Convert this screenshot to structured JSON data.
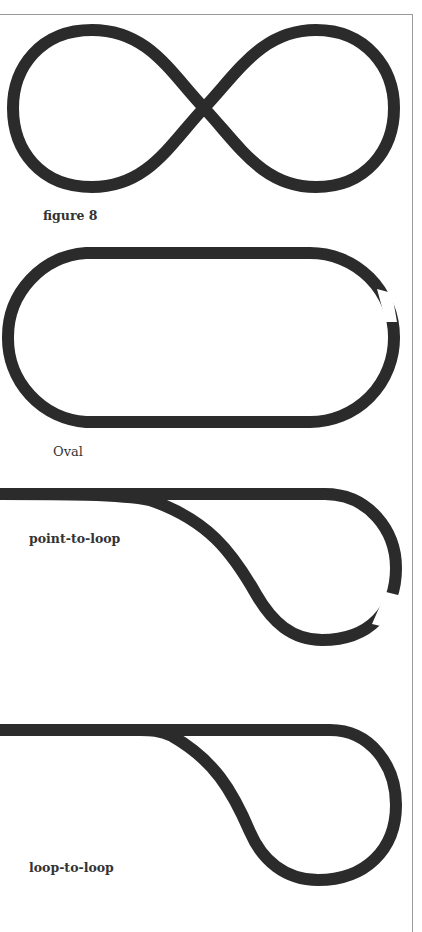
{
  "page": {
    "track_color": "#2b2b2b",
    "frame_color": "#9a9a9a",
    "background": "#ffffff"
  },
  "layouts": [
    {
      "id": "figure-8",
      "label": "figure 8"
    },
    {
      "id": "oval",
      "label": "Oval"
    },
    {
      "id": "point-to-loop",
      "label": "point-to-loop"
    },
    {
      "id": "loop-to-loop",
      "label": "loop-to-loop"
    }
  ]
}
